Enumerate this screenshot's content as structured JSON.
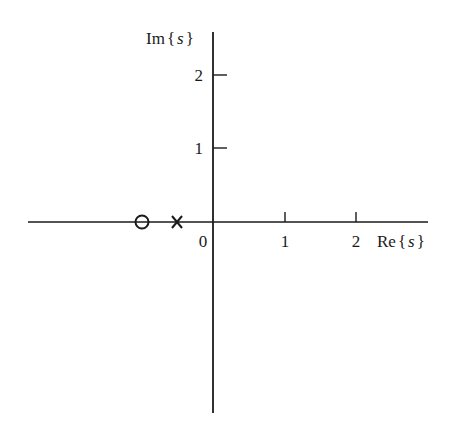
{
  "diagram": {
    "type": "s-plane pole-zero plot",
    "axes": {
      "real_label": "Re{s}",
      "imag_label": "Im{s}",
      "real_label_parts": {
        "prefix": "Re",
        "open": "{",
        "var": "s",
        "close": "}"
      },
      "imag_label_parts": {
        "prefix": "Im",
        "open": "{",
        "var": "s",
        "close": "}"
      },
      "origin_label": "0",
      "real_ticks": [
        {
          "value": 1,
          "label": "1"
        },
        {
          "value": 2,
          "label": "2"
        }
      ],
      "imag_ticks": [
        {
          "value": 1,
          "label": "1"
        },
        {
          "value": 2,
          "label": "2"
        }
      ]
    },
    "zeros": [
      {
        "re": -1,
        "im": 0,
        "marker": "o"
      }
    ],
    "poles": [
      {
        "re": -0.5,
        "im": 0,
        "marker": "x"
      }
    ],
    "colors": {
      "ink": "#1a1a1a",
      "background": "#ffffff"
    }
  }
}
